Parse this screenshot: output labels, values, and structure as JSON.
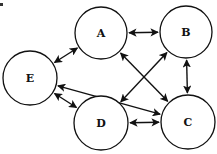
{
  "diagram": {
    "type": "directed-graph",
    "colors": {
      "stroke": "#111111",
      "node_fill": "#ffffff",
      "background": "#ffffff"
    },
    "nodes": [
      {
        "id": "A",
        "label": "A",
        "cx": 101,
        "cy": 33,
        "r": 26
      },
      {
        "id": "B",
        "label": "B",
        "cx": 186,
        "cy": 32,
        "r": 26
      },
      {
        "id": "C",
        "label": "C",
        "cx": 188,
        "cy": 122,
        "r": 27
      },
      {
        "id": "D",
        "label": "D",
        "cx": 101,
        "cy": 123,
        "r": 27
      },
      {
        "id": "E",
        "label": "E",
        "cx": 30,
        "cy": 78,
        "r": 27
      }
    ],
    "edges": [
      {
        "from": "A",
        "to": "B",
        "bidirectional": true
      },
      {
        "from": "B",
        "to": "C",
        "bidirectional": true
      },
      {
        "from": "C",
        "to": "D",
        "bidirectional": true
      },
      {
        "from": "E",
        "to": "A",
        "bidirectional": true
      },
      {
        "from": "E",
        "to": "D",
        "bidirectional": true
      },
      {
        "from": "E",
        "to": "C",
        "bidirectional": true
      },
      {
        "from": "A",
        "to": "C",
        "bidirectional": true
      },
      {
        "from": "D",
        "to": "B",
        "bidirectional": true
      }
    ]
  }
}
